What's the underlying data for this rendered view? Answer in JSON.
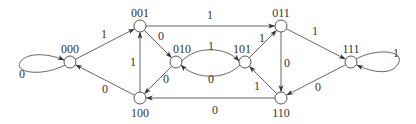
{
  "diagram": {
    "type": "state-transition-diagram",
    "colors": {
      "line": "#555555",
      "node_stroke": "#444444",
      "node_fill": "#ffffff",
      "text": "#333333",
      "background": "#ffffff"
    },
    "nodes": [
      {
        "id": "000",
        "label": "000",
        "x": 70,
        "y": 62,
        "label_dx": 0,
        "label_dy": -9
      },
      {
        "id": "001",
        "label": "001",
        "x": 140,
        "y": 26,
        "label_dx": 0,
        "label_dy": -9
      },
      {
        "id": "010",
        "label": "010",
        "x": 176,
        "y": 62,
        "label_dx": 6,
        "label_dy": -9
      },
      {
        "id": "100",
        "label": "100",
        "x": 140,
        "y": 98,
        "label_dx": 0,
        "label_dy": 19
      },
      {
        "id": "101",
        "label": "101",
        "x": 245,
        "y": 62,
        "label_dx": -3,
        "label_dy": -9
      },
      {
        "id": "011",
        "label": "011",
        "x": 281,
        "y": 26,
        "label_dx": 0,
        "label_dy": -9
      },
      {
        "id": "110",
        "label": "110",
        "x": 281,
        "y": 98,
        "label_dx": 0,
        "label_dy": 19
      },
      {
        "id": "111",
        "label": "111",
        "x": 351,
        "y": 62,
        "label_dx": 0,
        "label_dy": -9
      }
    ],
    "edges": [
      {
        "from": "000",
        "to": "000",
        "label": "0",
        "kind": "loop-left",
        "label_x": 22,
        "label_y": 78
      },
      {
        "from": "000",
        "to": "001",
        "label": "1",
        "kind": "straight",
        "label_x": 104,
        "label_y": 38
      },
      {
        "from": "100",
        "to": "000",
        "label": "0",
        "kind": "straight",
        "label_x": 105,
        "label_y": 93
      },
      {
        "from": "001",
        "to": "010",
        "label": "0",
        "kind": "straight",
        "label_x": 161,
        "label_y": 40
      },
      {
        "from": "001",
        "to": "011",
        "label": "1",
        "kind": "straight",
        "label_x": 210,
        "label_y": 19
      },
      {
        "from": "100",
        "to": "001",
        "label": "1",
        "kind": "straight",
        "label_x": 133,
        "label_y": 66
      },
      {
        "from": "010",
        "to": "100",
        "label": "0",
        "kind": "straight",
        "label_x": 166,
        "label_y": 83
      },
      {
        "from": "010",
        "to": "101",
        "label": "1",
        "kind": "curve-up",
        "label_x": 211,
        "label_y": 50
      },
      {
        "from": "101",
        "to": "010",
        "label": "0",
        "kind": "curve-down",
        "label_x": 211,
        "label_y": 83
      },
      {
        "from": "101",
        "to": "011",
        "label": "1",
        "kind": "straight",
        "label_x": 262,
        "label_y": 42
      },
      {
        "from": "110",
        "to": "101",
        "label": "1",
        "kind": "straight",
        "label_x": 257,
        "label_y": 90
      },
      {
        "from": "011",
        "to": "110",
        "label": "0",
        "kind": "straight",
        "label_x": 287,
        "label_y": 67
      },
      {
        "from": "110",
        "to": "100",
        "label": "0",
        "kind": "straight",
        "label_x": 215,
        "label_y": 114
      },
      {
        "from": "011",
        "to": "111",
        "label": "1",
        "kind": "straight",
        "label_x": 315,
        "label_y": 35
      },
      {
        "from": "111",
        "to": "110",
        "label": "0",
        "kind": "straight",
        "label_x": 318,
        "label_y": 91
      },
      {
        "from": "111",
        "to": "111",
        "label": "1",
        "kind": "loop-right",
        "label_x": 396,
        "label_y": 57
      }
    ]
  }
}
